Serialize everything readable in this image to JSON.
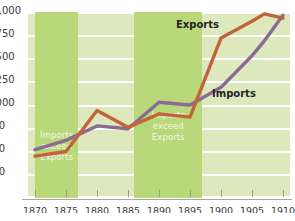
{
  "chart_data": {
    "type": "line",
    "title": "",
    "subtitle": "",
    "xlabel": "",
    "ylabel": "",
    "xlim": [
      1870,
      1910
    ],
    "ylim": [
      0,
      2000
    ],
    "grid": true,
    "legend_position": "inline-annotation",
    "x_ticks": [
      "1870",
      "1875",
      "1880",
      "1885",
      "1890",
      "1895",
      "1900",
      "1905",
      "1910"
    ],
    "y_ticks": [
      "0",
      "250",
      "500",
      "750",
      "1,000",
      "1,250",
      "1,500",
      "1,750",
      "$2,000"
    ],
    "y_tick_values": [
      0,
      250,
      500,
      750,
      1000,
      1250,
      1500,
      1750,
      2000
    ],
    "x": [
      1870,
      1875,
      1880,
      1885,
      1890,
      1895,
      1900,
      1905,
      1907,
      1910
    ],
    "series": [
      {
        "name": "Imports",
        "color": "#8a6b96",
        "values": [
          520,
          620,
          775,
          745,
          1030,
          1000,
          1190,
          1530,
          1690,
          1965
        ]
      },
      {
        "name": "Exports",
        "color": "#c1643c",
        "values": [
          450,
          500,
          940,
          760,
          905,
          870,
          1720,
          1900,
          1980,
          1935
        ]
      }
    ],
    "annotations": [
      {
        "name": "exports-label",
        "text": "Exports"
      },
      {
        "name": "imports-label",
        "text": "Imports"
      }
    ],
    "shaded_bands": [
      {
        "name": "band-1870-1877",
        "x_start": 1870,
        "x_end": 1877,
        "color": "#b9d87a",
        "label_lines": [
          "Imports",
          "exceed",
          "Exports"
        ]
      },
      {
        "name": "band-1886-1897",
        "x_start": 1886,
        "x_end": 1897,
        "color": "#b9d87a",
        "label_lines": [
          "Imports",
          "exceed",
          "Exports"
        ]
      }
    ],
    "colors": {
      "plot_background": "#dde9bd",
      "band_fill": "#b9d87a",
      "gridline": "#ffffff",
      "imports_line": "#8a6b96",
      "exports_line": "#c1643c",
      "text": "#3b3b38"
    }
  },
  "axes": {
    "y_labels": [
      "$2,000",
      "1,750",
      "1,500",
      "1,250",
      "1,000",
      "750",
      "500",
      "250",
      "0"
    ],
    "x_labels": [
      "1870",
      "1875",
      "1880",
      "1885",
      "1890",
      "1895",
      "1900",
      "1905",
      "1910"
    ]
  },
  "bands": {
    "first": {
      "line1": "Imports",
      "line2": "exceed",
      "line3": "Exports"
    },
    "second": {
      "line1": "Imports",
      "line2": "exceed",
      "line3": "Exports"
    }
  },
  "labels": {
    "exports": "Exports",
    "imports": "Imports"
  }
}
